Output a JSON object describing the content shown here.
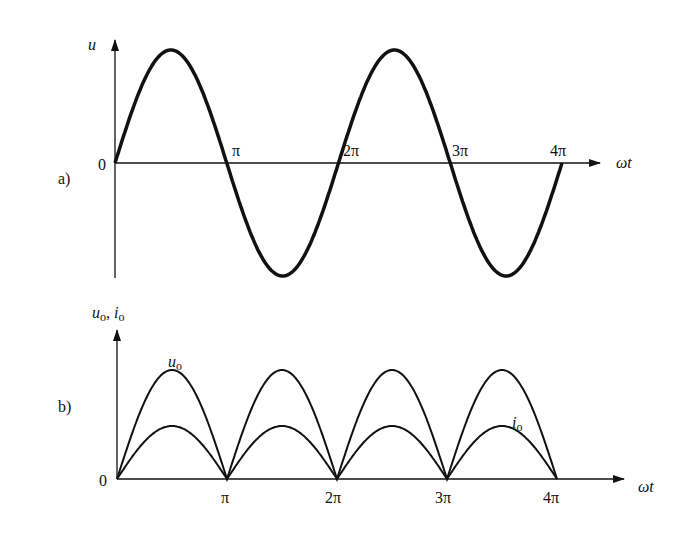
{
  "panel_a": {
    "label": "a)",
    "y_axis_label": "u",
    "x_axis_label": "ωt",
    "origin_label": "0",
    "ticks": [
      "π",
      "2π",
      "3π",
      "4π"
    ],
    "curve": "sine wave over 0 to 4π"
  },
  "panel_b": {
    "label": "b)",
    "y_axis_label": "u",
    "y_axis_label_sub": "o",
    "y_axis_label2": "i",
    "y_axis_label2_sub": "o",
    "x_axis_label": "ωt",
    "origin_label": "0",
    "ticks": [
      "π",
      "2π",
      "3π",
      "4π"
    ],
    "curve_u_label": "u",
    "curve_u_sub": "o",
    "curve_i_label": "i",
    "curve_i_sub": "o"
  }
}
